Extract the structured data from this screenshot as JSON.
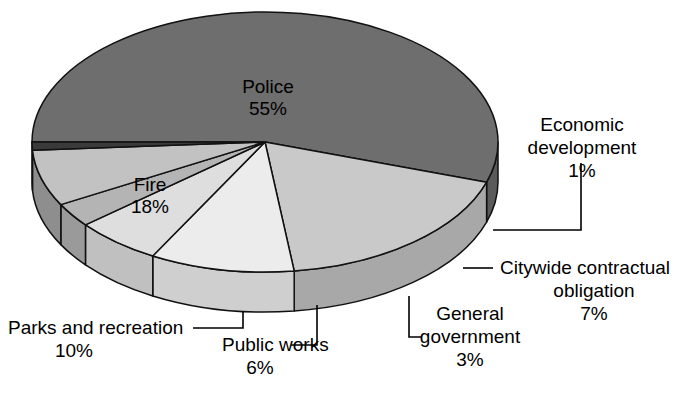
{
  "chart_data": {
    "type": "pie",
    "title": "",
    "subtitle": "",
    "xlabel": "",
    "ylabel": "",
    "legend_position": "none",
    "grid": false,
    "style": "3d-exploded-pie",
    "units": "percent",
    "total": 100,
    "categories": [
      "Police",
      "Fire",
      "Parks and recreation",
      "Public works",
      "General government",
      "Citywide contractual obligation",
      "Economic development"
    ],
    "values": [
      55,
      18,
      10,
      6,
      3,
      7,
      1
    ],
    "slices": [
      {
        "name": "Police",
        "label": "Police",
        "value": 55,
        "value_text": "55%",
        "color": "#6e6e6e",
        "side_color": "#5a5a5a",
        "label_placement": "inside"
      },
      {
        "name": "Fire",
        "label": "Fire",
        "value": 18,
        "value_text": "18%",
        "color": "#c9c9c9",
        "side_color": "#a8a8a8",
        "label_placement": "inside"
      },
      {
        "name": "Parks and recreation",
        "label": "Parks and recreation",
        "value": 10,
        "value_text": "10%",
        "color": "#ececec",
        "side_color": "#cfcfcf",
        "label_placement": "callout"
      },
      {
        "name": "Public works",
        "label": "Public works",
        "value": 6,
        "value_text": "6%",
        "color": "#dedede",
        "side_color": "#c0c0c0",
        "label_placement": "callout"
      },
      {
        "name": "General government",
        "label": "General government",
        "value": 3,
        "value_text": "3%",
        "color": "#b4b4b4",
        "side_color": "#9a9a9a",
        "label_placement": "callout"
      },
      {
        "name": "Citywide contractual obligation",
        "label": "Citywide contractual obligation",
        "value": 7,
        "value_text": "7%",
        "color": "#c2c2c2",
        "side_color": "#8e8e8e",
        "label_placement": "callout"
      },
      {
        "name": "Economic development",
        "label": "Economic development",
        "value": 1,
        "value_text": "1%",
        "color": "#3a3a3a",
        "side_color": "#2a2a2a",
        "label_placement": "callout"
      }
    ]
  },
  "labels": {
    "police": {
      "line1": "Police",
      "line2": "55%"
    },
    "fire": {
      "line1": "Fire",
      "line2": "18%"
    },
    "parks": {
      "line1": "Parks and recreation",
      "line2": "10%"
    },
    "public_works": {
      "line1": "Public works",
      "line2": "6%"
    },
    "general_government": {
      "line1": "General",
      "line2": "government",
      "line3": "3%"
    },
    "citywide": {
      "line1": "Citywide contractual",
      "line2": "obligation",
      "line3": "7%"
    },
    "economic": {
      "line1": "Economic",
      "line2": "development",
      "line3": "1%"
    }
  },
  "colors": {
    "background": "#ffffff",
    "outline": "#111111",
    "text": "#000000"
  }
}
